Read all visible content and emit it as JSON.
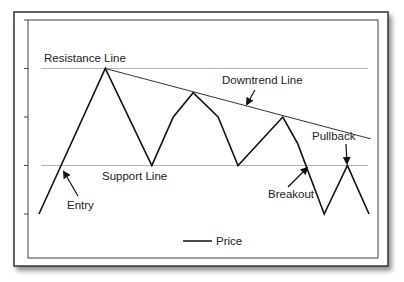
{
  "chart_data": {
    "type": "line",
    "title": "",
    "xlabel": "",
    "ylabel": "",
    "ylim": [
      1,
      5
    ],
    "xlim": [
      0,
      11
    ],
    "y_ticks": [
      1,
      2,
      3,
      4,
      5
    ],
    "grid": false,
    "legend": {
      "position": "bottom-center",
      "entries": [
        "Price"
      ]
    },
    "series": [
      {
        "name": "Price",
        "x": [
          0,
          2,
          3.4,
          4.05,
          4.65,
          5.4,
          6.0,
          7.35,
          7.8,
          8.6,
          9.3,
          9.95
        ],
        "values": [
          1,
          4,
          2,
          3,
          3.5,
          3,
          2,
          3,
          2.45,
          1,
          2,
          1
        ]
      }
    ],
    "reference_lines": [
      {
        "name": "Resistance Line",
        "type": "horizontal",
        "y": 4
      },
      {
        "name": "Support Line",
        "type": "horizontal",
        "y": 2
      },
      {
        "name": "Downtrend Line",
        "type": "trend",
        "points": [
          [
            2,
            4
          ],
          [
            10,
            2.55
          ]
        ]
      }
    ],
    "annotations": [
      {
        "text": "Resistance Line",
        "target": "resistance"
      },
      {
        "text": "Support Line",
        "target": "support"
      },
      {
        "text": "Downtrend Line",
        "target": "downtrend",
        "arrow": true
      },
      {
        "text": "Entry",
        "target": [
          0.7,
          2
        ],
        "arrow": true
      },
      {
        "text": "Breakout",
        "target": [
          8.15,
          2
        ],
        "arrow": true
      },
      {
        "text": "Pullback",
        "target": [
          9.3,
          2
        ],
        "arrow": true
      }
    ]
  }
}
